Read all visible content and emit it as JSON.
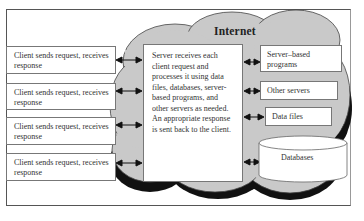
{
  "diagram": {
    "title": "Internet",
    "clients": [
      {
        "label": "Client sends request, receives response"
      },
      {
        "label": "Client sends request, receives response"
      },
      {
        "label": "Client sends request, receives response"
      },
      {
        "label": "Client sends request, receives response"
      }
    ],
    "server": {
      "label": "Server receives each client request and processes it using data files, databases, server-based programs, and other servers as needed. An appropriate response is sent back to the client."
    },
    "resources": [
      {
        "label": "Server–based programs"
      },
      {
        "label": "Other servers"
      },
      {
        "label": "Data files"
      },
      {
        "label": "Databases"
      }
    ],
    "colors": {
      "cloud_fill": "#c9c9c9",
      "cloud_shadow": "#111111",
      "box_fill": "#ffffff",
      "border": "#777777"
    }
  }
}
